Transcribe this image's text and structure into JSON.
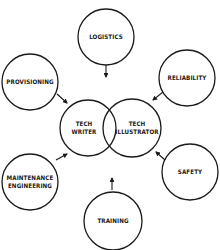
{
  "diagram": {
    "center": [
      {
        "id": "tech-writer",
        "lines": [
          "TECH",
          "WRITER"
        ],
        "cx": 88,
        "cy": 128,
        "r": 28
      },
      {
        "id": "tech-illustrator",
        "lines": [
          "TECH",
          "ILLUSTRATOR"
        ],
        "cx": 132,
        "cy": 128,
        "r": 29
      }
    ],
    "nodes": [
      {
        "id": "logistics",
        "lines": [
          "LOGISTICS"
        ],
        "cx": 106,
        "cy": 37,
        "r": 28
      },
      {
        "id": "reliability",
        "lines": [
          "RELIABILITY"
        ],
        "cx": 187,
        "cy": 78,
        "r": 28
      },
      {
        "id": "safety",
        "lines": [
          "SAFETY"
        ],
        "cx": 190,
        "cy": 172,
        "r": 28
      },
      {
        "id": "training",
        "lines": [
          "TRAINING"
        ],
        "cx": 113,
        "cy": 221,
        "r": 29
      },
      {
        "id": "maintenance-engineering",
        "lines": [
          "MAINTENANCE",
          "ENGINEERING"
        ],
        "cx": 30,
        "cy": 182,
        "r": 28
      },
      {
        "id": "provisioning",
        "lines": [
          "PROVISIONING"
        ],
        "cx": 30,
        "cy": 82,
        "r": 28
      }
    ],
    "arrows": [
      {
        "from": "logistics",
        "x1": 106,
        "y1": 65,
        "x2": 106,
        "y2": 77
      },
      {
        "from": "reliability",
        "x1": 163,
        "y1": 92,
        "x2": 153,
        "y2": 100
      },
      {
        "from": "safety",
        "x1": 165,
        "y1": 160,
        "x2": 156,
        "y2": 152
      },
      {
        "from": "training",
        "x1": 112,
        "y1": 190,
        "x2": 112,
        "y2": 178
      },
      {
        "from": "maintenance-engineering",
        "x1": 56,
        "y1": 160,
        "x2": 67,
        "y2": 154
      },
      {
        "from": "provisioning",
        "x1": 57,
        "y1": 94,
        "x2": 67,
        "y2": 103
      }
    ]
  }
}
